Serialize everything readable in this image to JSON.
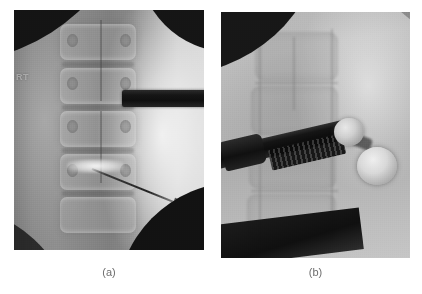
{
  "figure": {
    "type": "fluoroscopic-radiograph-figure",
    "background_color": "#ffffff",
    "panel_count": 2,
    "caption_color": "#6e6e6e"
  },
  "panels": [
    {
      "id": "a",
      "caption": "(a)",
      "view": "anteroposterior lumbar spine fluoroscopy",
      "laterality_marker": "RT",
      "field_shape": "circular fluoroscopy field with dark corner vignettes",
      "base_tone": "#888888",
      "bright_band_tone": "#d8d8d8",
      "dark_vignette_tone": "#141414",
      "instruments": [
        {
          "name": "horizontal-radiopaque-bar",
          "description": "dark metallic instrument bar entering from the right side",
          "color": "#0f0f0f"
        },
        {
          "name": "diagonal-needle",
          "description": "thin radiopaque needle angled down-right in the lower vertebral region",
          "color": "#1e1e1e"
        }
      ],
      "anatomy": {
        "vertebral_bodies": 5,
        "features": [
          "vertebral endplates",
          "intervertebral disc spaces",
          "pedicles",
          "spinous process midline"
        ],
        "bright_disc_space": "contrast-opacified disc level"
      }
    },
    {
      "id": "b",
      "caption": "(b)",
      "view": "oblique lumbar spine fluoroscopy",
      "laterality_marker": "",
      "field_shape": "circular fluoroscopy field with dark top-left vignette",
      "base_tone": "#b4b4b4",
      "bright_band_tone": "#dcdcdc",
      "dark_vignette_tone": "#171717",
      "instruments": [
        {
          "name": "angled-instrument-shaft",
          "description": "dark angled metallic shaft entering from the left with serrated textured mid-section",
          "color": "#0d0d0d"
        },
        {
          "name": "upper-spherical-marker",
          "description": "bright rounded radiopaque sphere at instrument tip",
          "color": "#cfcfcf"
        },
        {
          "name": "lower-spherical-marker",
          "description": "larger bright rounded radiopaque sphere below and right of the upper sphere",
          "color": "#d8d8d8"
        }
      ],
      "anatomy": {
        "vertebral_bodies": 4,
        "features": [
          "vertebral body outlines",
          "endplate margins",
          "posterior elements"
        ],
        "bright_disc_space": ""
      }
    }
  ],
  "captions": {
    "panel_a_label": "(a)",
    "panel_b_label": "(b)"
  }
}
